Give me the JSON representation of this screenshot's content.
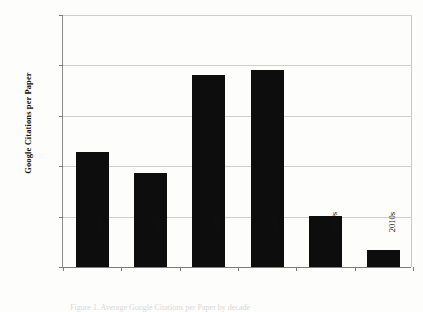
{
  "chart_data": {
    "type": "bar",
    "title": "",
    "xlabel": "",
    "ylabel": "Google Citations per Paper",
    "categories": [
      "1960s",
      "1970s",
      "1980s",
      "1990s",
      "2000s",
      "2010s"
    ],
    "values": [
      1140,
      930,
      1900,
      1955,
      510,
      170
    ],
    "ylim": [
      0,
      2500
    ],
    "yticks": [
      0,
      500,
      1000,
      1500,
      2000,
      2500
    ],
    "ytick_labels": [
      "0",
      "500",
      "1,000",
      "1,500",
      "2,000",
      "2,500"
    ],
    "grid": true,
    "legend": false,
    "bar_color": "#0d0d0d",
    "gridline_color": "#cfcfcf",
    "axis_color": "#7c7c7c",
    "background_color": "#fdfdfc"
  },
  "caption": {
    "text": "Figure 1. Average Google Citations per Paper by decade"
  }
}
